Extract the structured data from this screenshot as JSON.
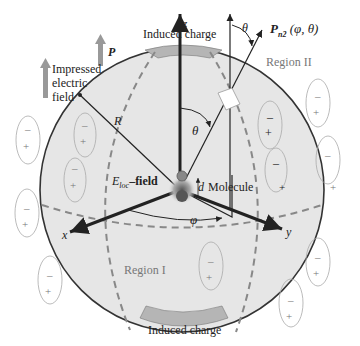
{
  "diagram": {
    "type": "spherical-cavity-polarization",
    "labels": {
      "induced_charge_top": "Induced charge",
      "induced_charge_bottom": "Induced charge",
      "impressed_field": "Impressed electric field",
      "impressed_line1": "Impressed",
      "impressed_line2": "electric",
      "impressed_line3": "field",
      "polarization": "P",
      "axis_z": "z",
      "axis_x": "x",
      "axis_y": "y",
      "theta_top": "θ",
      "theta_inner": "θ",
      "phi": "φ",
      "radius": "R",
      "dipole_distance": "d",
      "molecule": "Molecule",
      "eloc_field_sym": "E",
      "eloc_field_sub": "loc",
      "eloc_field_suffix": "–field",
      "pn2": "P",
      "pn2_sub": "n2",
      "pn2_args": "(φ, θ)",
      "region1": "Region I",
      "region2": "Region II"
    },
    "dipole_signs": {
      "minus": "–",
      "plus": "+"
    },
    "colors": {
      "sphere_fill": "#e6e6e6",
      "sphere_stroke": "#333333",
      "dashed": "#888888",
      "arrow_gray": "#999999",
      "charge_patch": "#b5b5b5"
    }
  }
}
